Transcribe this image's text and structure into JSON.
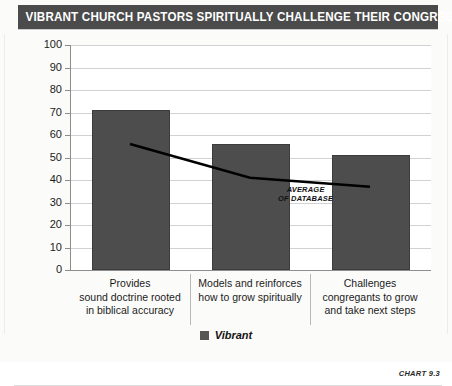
{
  "title": "VIBRANT CHURCH PASTORS SPIRITUALLY CHALLENGE THEIR CONGREGATIONS",
  "legend": {
    "series_label": "Vibrant",
    "swatch_color": "#565656"
  },
  "annotation": {
    "line1": "AVERAGE",
    "line2": "OF DATABASE"
  },
  "chart_number": "CHART 9.3",
  "chart_data": {
    "type": "bar",
    "title": "VIBRANT CHURCH PASTORS SPIRITUALLY CHALLENGE THEIR CONGREGATIONS",
    "xlabel": "",
    "ylabel": "",
    "ylim": [
      0,
      100
    ],
    "yticks": [
      0,
      10,
      20,
      30,
      40,
      50,
      60,
      70,
      80,
      90,
      100
    ],
    "ytick_labels": [
      "0",
      "10",
      "20",
      "30",
      "40",
      "50",
      "60",
      "70",
      "80",
      "90",
      "100"
    ],
    "grid": true,
    "legend_position": "bottom",
    "categories": [
      "Provides sound doctrine rooted in biblical accuracy",
      "Models and reinforces how to grow spiritually",
      "Challenges congregants to grow and take next steps"
    ],
    "category_lines": [
      [
        "Provides",
        "sound doctrine rooted",
        "in biblical accuracy"
      ],
      [
        "Models and reinforces",
        "how to grow spiritually"
      ],
      [
        "Challenges",
        "congregants to grow",
        "and take next steps"
      ]
    ],
    "series": [
      {
        "name": "Vibrant",
        "type": "bar",
        "color": "#4d4d4d",
        "values": [
          71,
          56,
          51
        ]
      },
      {
        "name": "Average of database",
        "type": "line",
        "color": "#000000",
        "values": [
          56,
          41,
          37
        ],
        "annotation": "AVERAGE OF DATABASE"
      }
    ]
  }
}
